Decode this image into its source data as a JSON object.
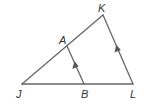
{
  "diagram": {
    "type": "geometry-triangle",
    "points": {
      "J": {
        "label": "J",
        "x": 22,
        "y": 84
      },
      "K": {
        "label": "K",
        "x": 103,
        "y": 15
      },
      "L": {
        "label": "L",
        "x": 133,
        "y": 84
      },
      "A": {
        "label": "A",
        "x": 67,
        "y": 46
      },
      "B": {
        "label": "B",
        "x": 84,
        "y": 84
      }
    },
    "segments": [
      "JK",
      "KL",
      "JL",
      "AB"
    ],
    "parallel_marks": [
      "AB",
      "KL"
    ],
    "colors": {
      "line": "#666666",
      "arrow": "#555555",
      "label": "#333333"
    }
  }
}
